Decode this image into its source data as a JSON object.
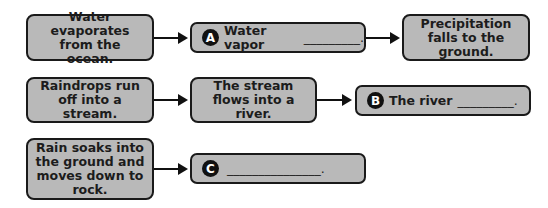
{
  "rows": [
    {
      "steps": [
        {
          "text": "Water evaporates from the ocean."
        },
        {
          "label": "A",
          "text": "Water vapor",
          "blank": "_________."
        },
        {
          "text": "Precipitation falls to the ground."
        }
      ]
    },
    {
      "steps": [
        {
          "text": "Raindrops run off into a stream."
        },
        {
          "text": "The stream flows into a river."
        },
        {
          "label": "B",
          "text": "The river",
          "blank": "_________."
        }
      ]
    },
    {
      "steps": [
        {
          "text": "Rain soaks into the ground and moves down to rock."
        },
        {
          "label": "C",
          "text": "",
          "blank": "_______________."
        }
      ]
    }
  ],
  "colors": {
    "box_fill": "#b9b9b9",
    "border": "#1a1a1a",
    "badge": "#111111"
  }
}
